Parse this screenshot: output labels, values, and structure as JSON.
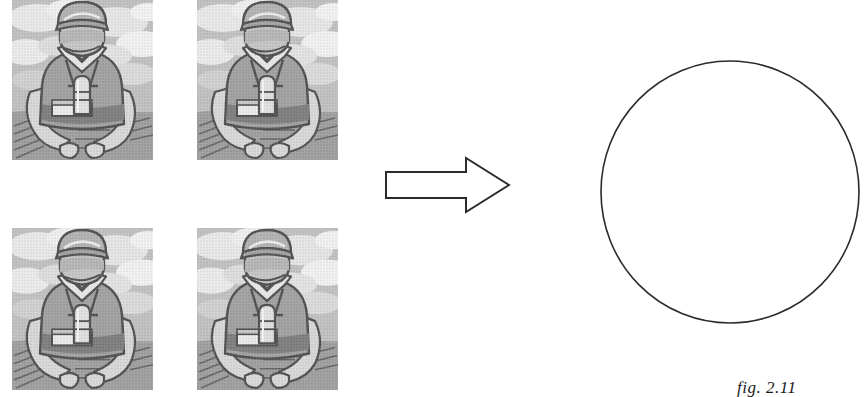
{
  "figure": {
    "kind": "diagram",
    "background_color": "#ffffff",
    "caption": "fig. 2.11"
  },
  "tiles": {
    "label": "grayscale halftone illustration of a worker in bib overalls and cap, seated at a table with a thermos and a box, clouds in the background",
    "count": 4,
    "rows": 2,
    "cols": 2,
    "items": [
      {
        "id": "tile-top-left",
        "alt": "worker illustration tile 1"
      },
      {
        "id": "tile-top-right",
        "alt": "worker illustration tile 2"
      },
      {
        "id": "tile-bottom-left",
        "alt": "worker illustration tile 3"
      },
      {
        "id": "tile-bottom-right",
        "alt": "worker illustration tile 4"
      }
    ],
    "palette": {
      "sky_light": "#e8e8e8",
      "sky_mid": "#bcbcbc",
      "sky_dark": "#9a9a9a",
      "skin": "#cfcfcf",
      "overalls": "#8c8c8c",
      "overalls_dark": "#6e6e6e",
      "shirt": "#dcdcdc",
      "outline": "#2a2a2a",
      "table": "#7a7a7a"
    }
  },
  "arrow": {
    "label": "right pointing block arrow",
    "direction": "right",
    "fill": "#ffffff",
    "stroke": "#2b2b2b",
    "stroke_width": 2
  },
  "circle": {
    "label": "empty outlined circle",
    "fill": "#ffffff",
    "stroke": "#2b2b2b",
    "stroke_width": 1.6,
    "diameter_px": 258
  }
}
